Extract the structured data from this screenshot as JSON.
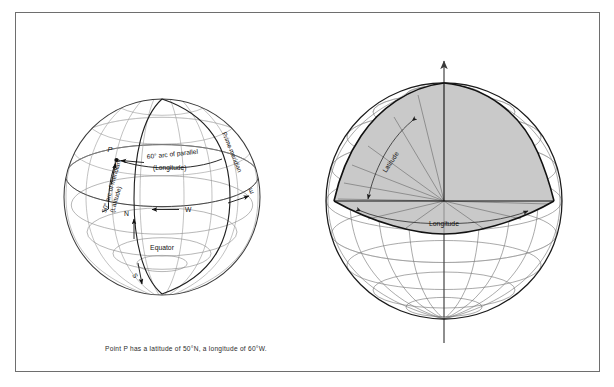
{
  "figure": {
    "caption": "Point P has a latitude of 50°N, a longitude of 60°W.",
    "border_color": "#6e6e6e",
    "background": "#ffffff"
  },
  "left_globe": {
    "name": "graticule-globe",
    "point_label": "P",
    "labels": {
      "arc_parallel_line1": "60° arc of parallel",
      "arc_parallel_line2": "(Longitude)",
      "arc_meridian_line1": "50° arc of meridian",
      "arc_meridian_line2": "(Latitude)",
      "prime_meridian": "Prime meridian",
      "equator": "Equator",
      "north": "N",
      "south": "S",
      "east": "E",
      "west": "W"
    },
    "grid_color": "#8f8f8f",
    "outline_color": "#3a3a3a",
    "accent_color": "#111111"
  },
  "right_globe": {
    "name": "wedge-globe",
    "labels": {
      "latitude": "Latitude",
      "longitude": "Longitude"
    },
    "wedge_fill": "#c9c9c9",
    "grid_color": "#6f6f6f",
    "outline_color": "#1a1a1a",
    "axis_color": "#4a4a4a"
  }
}
